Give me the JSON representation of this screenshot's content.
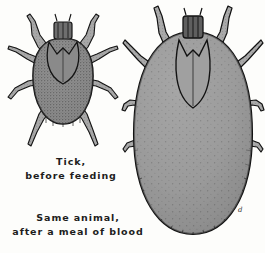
{
  "plate": {
    "title": "Tick before and after feeding",
    "background_color": "#fdfdfb",
    "ink_color": "#1d1d1d",
    "width": 265,
    "height": 253,
    "medium": "engraving"
  },
  "figures": [
    {
      "id": "unfed-tick",
      "name": "Tick, before feeding",
      "body_fill": "#8d8d8d",
      "outline_color": "#141414",
      "leg_fill": "#a7a7a7",
      "leg_count": 8,
      "texture": "dense-stipple"
    },
    {
      "id": "engorged-tick",
      "name": "Same animal, after a meal of blood",
      "body_fill": "#9c9c9c",
      "outline_color": "#121212",
      "leg_fill": "#a9a9a9",
      "leg_count": 8,
      "texture": "sparse-stipple",
      "artist_mark": "d"
    }
  ],
  "captions": {
    "unfed": {
      "line1": "Tick,",
      "line2": "before feeding"
    },
    "engorged": {
      "line1": "Same animal,",
      "line2": "after a meal of blood"
    }
  }
}
